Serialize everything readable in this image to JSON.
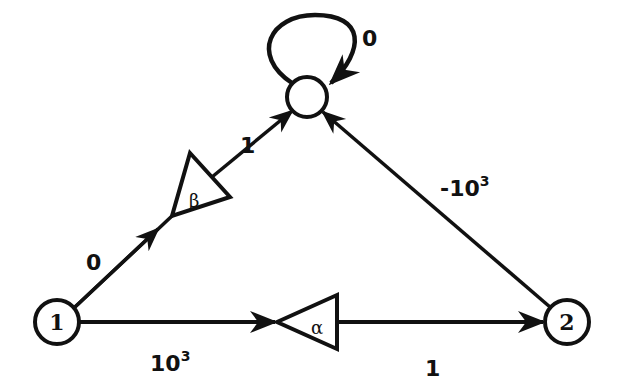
{
  "diagram": {
    "type": "signal-flow-graph",
    "nodes": [
      {
        "id": "top",
        "label": ""
      },
      {
        "id": "n1",
        "label": "1"
      },
      {
        "id": "n2",
        "label": "2"
      }
    ],
    "amplifiers": [
      {
        "id": "beta",
        "symbol": "β"
      },
      {
        "id": "alpha",
        "symbol": "α"
      }
    ],
    "edges": [
      {
        "from": "top",
        "to": "top",
        "label": "0"
      },
      {
        "from": "n1",
        "to": "beta",
        "label": "0"
      },
      {
        "from": "beta",
        "to": "top",
        "label": "1"
      },
      {
        "from": "n1",
        "to": "alpha",
        "label_base": "10",
        "label_exp": "3"
      },
      {
        "from": "alpha",
        "to": "n2",
        "label": "1"
      },
      {
        "from": "n2",
        "to": "top",
        "label_base": "-10",
        "label_exp": "3"
      }
    ]
  }
}
